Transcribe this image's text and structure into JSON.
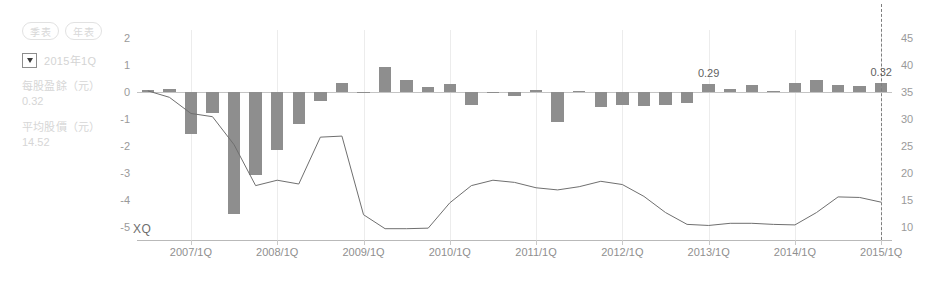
{
  "controls": {
    "period_toggles": [
      {
        "label": "季表",
        "name": "quarterly"
      },
      {
        "label": "年表",
        "name": "annual"
      }
    ],
    "selector": {
      "icon": "dropdown-caret-icon",
      "value": "2015年1Q",
      "checked": true
    },
    "metrics": [
      {
        "label": "每股盈餘（元）",
        "value": "0.32"
      },
      {
        "label": "平均股價（元）",
        "value": "14.52"
      }
    ]
  },
  "watermark": "XQ",
  "chart_data": {
    "type": "bar",
    "title": "",
    "xlabel": "",
    "ylabel": "每股盈餘（元）",
    "y2label": "平均股價（元）",
    "ylim": [
      -5.5,
      2.3
    ],
    "y2lim": [
      7.5,
      46.5
    ],
    "grid": true,
    "legend_position": "none",
    "y_ticks": [
      2,
      1,
      0,
      -1,
      -2,
      -3,
      -4,
      -5
    ],
    "y2_ticks": [
      45,
      40,
      35,
      30,
      25,
      20,
      15,
      10
    ],
    "x_tick_labels": [
      "2007/1Q",
      "2008/1Q",
      "2009/1Q",
      "2010/1Q",
      "2011/1Q",
      "2012/1Q",
      "2013/1Q",
      "2014/1Q",
      "2015/1Q"
    ],
    "x_tick_indices": [
      2,
      6,
      10,
      14,
      18,
      22,
      26,
      30,
      34
    ],
    "categories": [
      "2006/3Q",
      "2006/4Q",
      "2007/1Q",
      "2007/2Q",
      "2007/3Q",
      "2007/4Q",
      "2008/1Q",
      "2008/2Q",
      "2008/3Q",
      "2008/4Q",
      "2009/1Q",
      "2009/2Q",
      "2009/3Q",
      "2009/4Q",
      "2010/1Q",
      "2010/2Q",
      "2010/3Q",
      "2010/4Q",
      "2011/1Q",
      "2011/2Q",
      "2011/3Q",
      "2011/4Q",
      "2012/1Q",
      "2012/2Q",
      "2012/3Q",
      "2012/4Q",
      "2013/1Q",
      "2013/2Q",
      "2013/3Q",
      "2013/4Q",
      "2014/1Q",
      "2014/2Q",
      "2014/3Q",
      "2014/4Q",
      "2015/1Q"
    ],
    "series": [
      {
        "name": "每股盈餘（元）",
        "type": "bar",
        "axis": "left",
        "color": "#8e8e8e",
        "values": [
          0.06,
          0.1,
          -1.55,
          -0.78,
          -4.55,
          -3.1,
          -2.15,
          -1.18,
          -0.32,
          0.33,
          -0.04,
          0.92,
          0.44,
          0.2,
          0.3,
          -0.5,
          -0.04,
          -0.16,
          0.09,
          -1.1,
          0.04,
          -0.55,
          -0.48,
          -0.52,
          -0.5,
          -0.4,
          0.29,
          0.1,
          0.24,
          0.05,
          0.35,
          0.45,
          0.26,
          0.22,
          0.32
        ]
      },
      {
        "name": "平均股價（元）",
        "type": "line",
        "axis": "right",
        "color": "#6f6f6f",
        "values": [
          35.2,
          34.0,
          31.0,
          30.4,
          25.2,
          17.6,
          18.6,
          17.9,
          26.6,
          26.8,
          12.2,
          9.6,
          9.6,
          9.7,
          14.4,
          17.6,
          18.6,
          18.2,
          17.2,
          16.8,
          17.4,
          18.4,
          17.8,
          15.6,
          12.6,
          10.4,
          10.2,
          10.6,
          10.6,
          10.4,
          10.3,
          12.6,
          15.5,
          15.4,
          14.52
        ]
      }
    ],
    "data_labels": [
      {
        "index": 26,
        "text": "0.29"
      },
      {
        "index": 34,
        "text": "0.32"
      }
    ],
    "marker_line": {
      "index": 34,
      "style": "dashed",
      "color": "#7e7e7e"
    }
  }
}
